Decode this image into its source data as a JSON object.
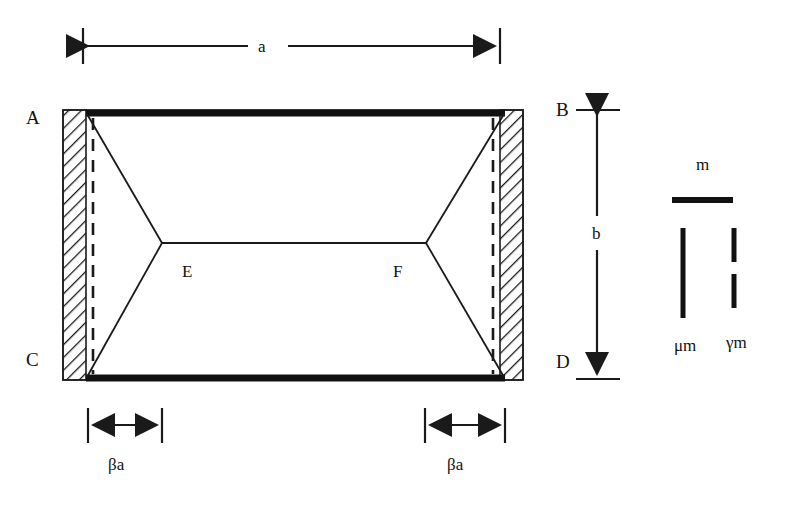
{
  "diagram": {
    "type": "engineering-diagram",
    "colors": {
      "stroke": "#1a1a1a",
      "thick_bar": "#111111",
      "hatch": "#1a1a1a",
      "background": "#ffffff"
    },
    "corner_labels": [
      {
        "name": "A",
        "text": "A",
        "x": 26,
        "y": 108
      },
      {
        "name": "B",
        "text": "B",
        "x": 556,
        "y": 100
      },
      {
        "name": "C",
        "text": "C",
        "x": 26,
        "y": 350
      },
      {
        "name": "D",
        "text": "D",
        "x": 556,
        "y": 352
      }
    ],
    "node_labels": [
      {
        "name": "E",
        "text": "E",
        "x": 182,
        "y": 263
      },
      {
        "name": "F",
        "text": "F",
        "x": 393,
        "y": 263
      }
    ],
    "dimensions": [
      {
        "name": "width-a",
        "label": "a",
        "orientation": "horizontal",
        "label_x": 258,
        "label_y": 45,
        "line_y": 46,
        "x_start": 83,
        "x_end": 500,
        "gap_start": 248,
        "gap_end": 288,
        "tick_top": 28,
        "tick_bottom": 64
      },
      {
        "name": "height-b",
        "label": "b",
        "orientation": "vertical",
        "label_x": 592,
        "label_y": 225,
        "line_x": 597,
        "y_start": 110,
        "y_end": 379,
        "gap_start": 216,
        "gap_end": 250,
        "tick_left": 576,
        "tick_right": 620
      },
      {
        "name": "band-width-left-beta-a",
        "label": "βa",
        "orientation": "horizontal",
        "label_x": 108,
        "label_y": 456,
        "line_y": 425,
        "x_start": 88,
        "x_end": 162,
        "tick_top": 408,
        "tick_bottom": 443
      },
      {
        "name": "band-width-right-beta-a",
        "label": "βa",
        "orientation": "horizontal",
        "label_x": 447,
        "label_y": 456,
        "line_y": 425,
        "x_start": 425,
        "x_end": 505,
        "tick_top": 408,
        "tick_bottom": 443
      }
    ],
    "legend": {
      "name": "moment-legend",
      "items": [
        {
          "name": "legend-m",
          "label": "m",
          "style": "thick-horizontal-bar",
          "label_x": 696,
          "label_y": 156,
          "bar_x1": 672,
          "bar_x2": 733,
          "bar_y": 200,
          "bar_thickness": 6
        },
        {
          "name": "legend-mu-m",
          "label": "μm",
          "style": "solid-vertical-bar",
          "label_x": 674,
          "label_y": 337,
          "bar_x": 683,
          "bar_y1": 228,
          "bar_y2": 318,
          "bar_thickness": 5
        },
        {
          "name": "legend-gamma-m",
          "label": "γm",
          "style": "dashed-vertical-bar",
          "label_x": 726,
          "label_y": 334,
          "bar_x": 734,
          "bar_y1": 228,
          "bar_y2": 318,
          "bar_thickness": 5,
          "dash_pattern": "34 12"
        }
      ]
    },
    "geometry": {
      "plate_left": 63,
      "plate_right": 523,
      "plate_top": 110,
      "plate_bottom": 380,
      "band_left_x1": 63,
      "band_left_x2": 86,
      "band_right_x1": 500,
      "band_right_x2": 523,
      "thick_bar_top_y": 113,
      "thick_bar_bottom_y": 378,
      "thick_bar_x1": 86,
      "thick_bar_x2": 505,
      "dashed_left_x": 93,
      "dashed_right_x": 493,
      "node_e_x": 162,
      "node_e_y": 243,
      "node_f_x": 426,
      "node_f_y": 243
    }
  }
}
